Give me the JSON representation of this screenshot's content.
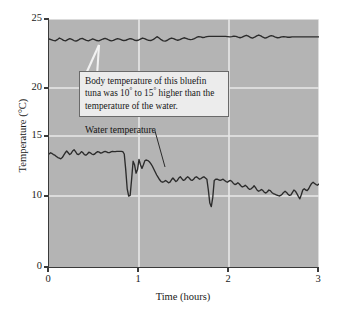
{
  "chart_data": {
    "type": "line",
    "title": "",
    "xlabel": "Time (hours)",
    "ylabel": "Temperature (°C)",
    "xlim": [
      0,
      3
    ],
    "ylim": [
      0,
      25
    ],
    "xticks": [
      0,
      1,
      2,
      3
    ],
    "xtick_labels": [
      "0",
      "1",
      "2",
      "3"
    ],
    "yticks": [
      0,
      10,
      15,
      20,
      25
    ],
    "ytick_labels": [
      "0",
      "10",
      "15",
      "20",
      "25"
    ],
    "y_axis_break": true,
    "y_axis_note": "axis compressed between 0 and 10; 5 tick omitted",
    "grid": true,
    "grid_color": "#e8e8e8",
    "plot_background": "#b4b4b4",
    "line_color": "#2b2b2b",
    "legend": "none",
    "series": [
      {
        "name": "Body temperature",
        "values": [
          23.55,
          23.5,
          23.45,
          23.42,
          23.5,
          23.62,
          23.55,
          23.45,
          23.42,
          23.5,
          23.58,
          23.52,
          23.44,
          23.4,
          23.46,
          23.56,
          23.6,
          23.52,
          23.45,
          23.42,
          23.48,
          23.56,
          23.5,
          23.44,
          23.42,
          23.48,
          23.55,
          23.6,
          23.54,
          23.46,
          23.42,
          23.45,
          23.52,
          23.58,
          23.54,
          23.48,
          23.44,
          23.46,
          23.52,
          23.58,
          23.55,
          23.48,
          23.44,
          23.46,
          23.54,
          23.62,
          23.58,
          23.5,
          23.45,
          23.44,
          23.5,
          23.6,
          23.72,
          23.62,
          23.5,
          23.42,
          23.4,
          23.46,
          23.56,
          23.62,
          23.58,
          23.5,
          23.46,
          23.5,
          23.58,
          23.64,
          23.6,
          23.54,
          23.5,
          23.52,
          23.58,
          23.66,
          23.72,
          23.7,
          23.66,
          23.68,
          23.72,
          23.74,
          23.74,
          23.74,
          23.74,
          23.74,
          23.74,
          23.74,
          23.74,
          23.74,
          23.72,
          23.7,
          23.72,
          23.76,
          23.74,
          23.68,
          23.64,
          23.68,
          23.76,
          23.82,
          23.76,
          23.66,
          23.62,
          23.68,
          23.78,
          23.84,
          23.78,
          23.68,
          23.62,
          23.66,
          23.74,
          23.8,
          23.76,
          23.68,
          23.64,
          23.66,
          23.7,
          23.72,
          23.7,
          23.68,
          23.68,
          23.7,
          23.7,
          23.7,
          23.7,
          23.7,
          23.7,
          23.7,
          23.7,
          23.7,
          23.7,
          23.7,
          23.7,
          23.7,
          23.7
        ]
      },
      {
        "name": "Water temperature",
        "values": [
          13.5,
          13.6,
          13.55,
          13.45,
          13.4,
          13.3,
          13.2,
          13.15,
          13.1,
          13.2,
          13.4,
          13.6,
          13.75,
          13.6,
          13.45,
          13.55,
          13.75,
          13.85,
          13.7,
          13.5,
          13.45,
          13.55,
          13.7,
          13.6,
          13.45,
          13.4,
          13.5,
          13.65,
          13.6,
          13.5,
          13.45,
          13.5,
          13.62,
          13.7,
          13.65,
          13.58,
          13.6,
          13.68,
          13.72,
          13.68,
          13.62,
          13.62,
          13.68,
          13.72,
          13.7,
          13.7,
          13.72,
          13.72,
          13.72,
          13.72,
          13.7,
          13.5,
          12.2,
          10.6,
          10.0,
          10.05,
          11.4,
          12.9,
          12.6,
          11.9,
          12.2,
          13.05,
          12.6,
          12.3,
          12.6,
          12.95,
          13.0,
          12.95,
          12.85,
          12.7,
          12.5,
          12.25,
          12.0,
          11.75,
          11.55,
          11.35,
          11.2,
          11.15,
          11.2,
          11.3,
          11.2,
          11.1,
          11.15,
          11.35,
          11.5,
          11.35,
          11.2,
          11.3,
          11.5,
          11.6,
          11.45,
          11.3,
          11.35,
          11.5,
          11.6,
          11.5,
          11.35,
          11.3,
          11.4,
          11.55,
          11.6,
          11.5,
          11.4,
          11.45,
          11.55,
          11.6,
          11.5,
          11.4,
          10.5,
          9.0,
          8.5,
          9.8,
          11.3,
          11.4,
          11.4,
          11.35,
          11.3,
          11.35,
          11.4,
          11.3,
          11.2,
          11.15,
          11.25,
          11.3,
          11.2,
          11.05,
          10.95,
          11.0,
          11.1,
          11.0,
          10.85,
          10.75,
          10.8,
          10.9,
          10.8,
          10.65,
          10.55,
          10.6,
          10.7,
          10.85,
          10.7,
          10.5,
          10.4,
          10.45,
          10.55,
          10.45,
          10.3,
          10.25,
          10.35,
          10.5,
          10.45,
          10.3,
          10.2,
          10.15,
          10.1,
          10.05,
          10.0,
          10.05,
          10.15,
          10.3,
          10.4,
          10.3,
          10.15,
          10.05,
          10.1,
          10.3,
          10.5,
          10.4,
          10.2,
          9.95,
          9.6,
          10.1,
          10.5,
          10.6,
          10.5,
          10.45,
          10.6,
          10.85,
          11.05,
          11.15,
          11.05,
          10.95,
          10.9,
          11.0
        ]
      }
    ],
    "annotations": [
      {
        "name": "body-temp-callout",
        "text_lines": [
          "Body temperature of this bluefin",
          "tuna was 10° to 15° higher than the",
          "temperature of the water."
        ],
        "points_to_series": "Body temperature"
      },
      {
        "name": "water-temp-label",
        "text": "Water temperature",
        "points_to_series": "Water temperature"
      }
    ]
  },
  "axes": {
    "x_title": "Time (hours)",
    "y_title": "Temperature (°C)",
    "x_ticks": [
      "0",
      "1",
      "2",
      "3"
    ],
    "y_ticks": [
      "25",
      "20",
      "15",
      "10",
      "0"
    ]
  },
  "callout": {
    "line1": "Body temperature of this bluefin",
    "line2_a": "tuna was 10",
    "line2_sup1": "°",
    "line2_b": " to 15",
    "line2_sup2": "°",
    "line2_c": " higher than the",
    "line3": "temperature of the water."
  },
  "labels": {
    "water_temperature": "Water temperature"
  }
}
